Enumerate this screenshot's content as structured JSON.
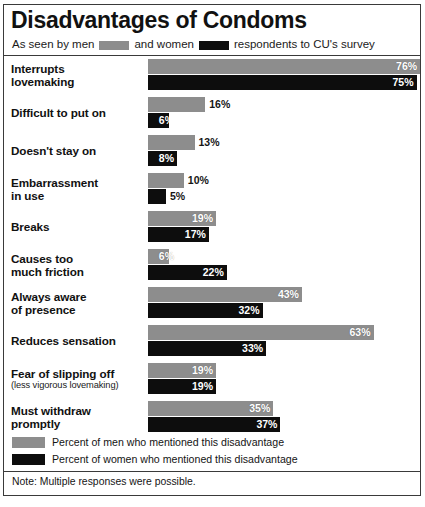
{
  "chart_data": {
    "type": "bar",
    "title": "Disadvantages of Condoms",
    "subtitle_parts": {
      "before_men": "As seen by men",
      "between": "and women",
      "after_women": "respondents to CU's survey"
    },
    "xlabel": "",
    "ylabel": "",
    "xlim": [
      0,
      80
    ],
    "grid": false,
    "orientation": "horizontal",
    "legend_position": "bottom",
    "value_suffix": "%",
    "categories": [
      "Interrupts lovemaking",
      "Difficult to put on",
      "Doesn't stay on",
      "Embarrassment in use",
      "Breaks",
      "Causes too much friction",
      "Always aware of presence",
      "Reduces sensation",
      "Fear of slipping off",
      "Must withdraw promptly"
    ],
    "series": [
      {
        "name": "Percent of men who mentioned this disadvantage",
        "color": "#8d8d8d",
        "values": [
          76,
          16,
          13,
          10,
          19,
          6,
          43,
          63,
          19,
          35
        ]
      },
      {
        "name": "Percent of women who mentioned this disadvantage",
        "color": "#0d0d0d",
        "values": [
          75,
          6,
          8,
          5,
          17,
          22,
          32,
          33,
          19,
          37
        ]
      }
    ],
    "annotations": [
      "Note: Multiple responses were possible."
    ]
  },
  "rows": [
    {
      "label_main": "Interrupts",
      "label_main2": "lovemaking",
      "label_sub": "",
      "men": {
        "value": 76,
        "text": "76%",
        "placement": "inside"
      },
      "women": {
        "value": 75,
        "text": "75%",
        "placement": "inside"
      }
    },
    {
      "label_main": "Difficult to put on",
      "label_main2": "",
      "label_sub": "",
      "men": {
        "value": 16,
        "text": "16%",
        "placement": "outside"
      },
      "women": {
        "value": 6,
        "text": "6%",
        "placement": "inside"
      }
    },
    {
      "label_main": "Doesn't stay on",
      "label_main2": "",
      "label_sub": "",
      "men": {
        "value": 13,
        "text": "13%",
        "placement": "outside"
      },
      "women": {
        "value": 8,
        "text": "8%",
        "placement": "inside"
      }
    },
    {
      "label_main": "Embarrassment",
      "label_main2": "in use",
      "label_sub": "",
      "men": {
        "value": 10,
        "text": "10%",
        "placement": "outside"
      },
      "women": {
        "value": 5,
        "text": "5%",
        "placement": "outside"
      }
    },
    {
      "label_main": "Breaks",
      "label_main2": "",
      "label_sub": "",
      "men": {
        "value": 19,
        "text": "19%",
        "placement": "inside"
      },
      "women": {
        "value": 17,
        "text": "17%",
        "placement": "inside"
      }
    },
    {
      "label_main": "Causes too",
      "label_main2": "much friction",
      "label_sub": "",
      "men": {
        "value": 6,
        "text": "6%",
        "placement": "inside"
      },
      "women": {
        "value": 22,
        "text": "22%",
        "placement": "inside"
      }
    },
    {
      "label_main": "Always aware",
      "label_main2": "of presence",
      "label_sub": "",
      "men": {
        "value": 43,
        "text": "43%",
        "placement": "inside"
      },
      "women": {
        "value": 32,
        "text": "32%",
        "placement": "inside"
      }
    },
    {
      "label_main": "Reduces sensation",
      "label_main2": "",
      "label_sub": "",
      "men": {
        "value": 63,
        "text": "63%",
        "placement": "inside"
      },
      "women": {
        "value": 33,
        "text": "33%",
        "placement": "inside"
      }
    },
    {
      "label_main": "Fear of slipping off",
      "label_main2": "",
      "label_sub": "(less vigorous lovemaking)",
      "men": {
        "value": 19,
        "text": "19%",
        "placement": "inside"
      },
      "women": {
        "value": 19,
        "text": "19%",
        "placement": "inside"
      }
    },
    {
      "label_main": "Must withdraw",
      "label_main2": "promptly",
      "label_sub": "",
      "men": {
        "value": 35,
        "text": "35%",
        "placement": "inside"
      },
      "women": {
        "value": 37,
        "text": "37%",
        "placement": "inside"
      }
    }
  ],
  "legend": {
    "men_label": "Percent of men who mentioned this disadvantage",
    "women_label": "Percent of women who mentioned this disadvantage",
    "note": "Note: Multiple responses were possible."
  },
  "colors": {
    "men": "#8d8d8d",
    "women": "#0d0d0d",
    "rule": "#3a3a3a",
    "text": "#111111"
  }
}
